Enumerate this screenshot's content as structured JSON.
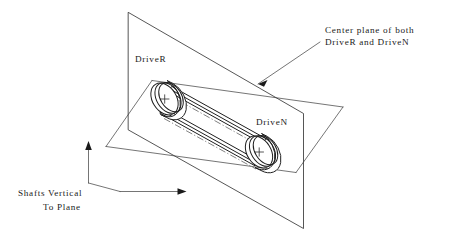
{
  "diagram": {
    "background_color": "#ffffff",
    "line_color": "#1f1f1f",
    "labels": {
      "driver": "DriveR",
      "driven": "DriveN",
      "center_plane_line1": "Center plane of both",
      "center_plane_line2": "DriveR and DriveN",
      "shafts_line1": "Shafts Vertical",
      "shafts_line2": "To Plane"
    },
    "annotations": [
      {
        "name": "center-plane-callout",
        "text": "Center plane of both DriveR and DriveN",
        "leader": "arrow pointing down-left to center plane"
      },
      {
        "name": "shafts-vertical-callout",
        "text": "Shafts Vertical To Plane",
        "leader": "two arrows, one to plane edge and one to plane face"
      }
    ],
    "parts": [
      {
        "name": "driver-pulley",
        "label": "DriveR",
        "center_mark": "+"
      },
      {
        "name": "driven-pulley",
        "label": "DriveN",
        "center_mark": "+"
      },
      {
        "name": "belt",
        "label": ""
      },
      {
        "name": "vertical-plane",
        "label": ""
      },
      {
        "name": "center-plane",
        "label": ""
      }
    ]
  }
}
